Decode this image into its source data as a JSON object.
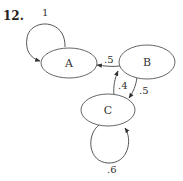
{
  "problem_number": "12.",
  "nodes": [
    {
      "id": "A",
      "label": "A"
    },
    {
      "id": "B",
      "label": "B"
    },
    {
      "id": "C",
      "label": "C"
    }
  ],
  "edges": [
    {
      "from": "A",
      "to": "A",
      "label": "1"
    },
    {
      "from": "B",
      "to": "A",
      "label": ".5"
    },
    {
      "from": "B",
      "to": "C",
      "label": ".5"
    },
    {
      "from": "C",
      "to": "B",
      "label": ".4"
    },
    {
      "from": "C",
      "to": "C",
      "label": ".6"
    }
  ]
}
